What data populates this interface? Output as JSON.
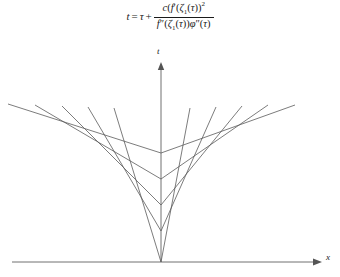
{
  "figure": {
    "title_formula": {
      "lhs": "t",
      "equals": "=",
      "tau": "τ",
      "plus": "+",
      "numerator": "c(f′(ζ₁(τ))²",
      "denominator": "f″(ζ₁(τ))φ″(τ)",
      "numerator_parts": {
        "c": "c",
        "open_paren": "(",
        "f": "f",
        "prime": "′",
        "open_paren2": "(",
        "zeta": "ζ",
        "zeta_sub": "1",
        "open_paren3": "(",
        "tau": "τ",
        "close_parens": "))",
        "exponent": "2"
      },
      "denominator_parts": {
        "f": "f",
        "double_prime": "″",
        "open_paren": "(",
        "zeta": "ζ",
        "zeta_sub": "1",
        "open_paren2": "(",
        "tau": "τ",
        "close_parens": "))",
        "phi": "φ",
        "phi_double_prime": "″",
        "open_paren3": "(",
        "tau2": "τ",
        "close_paren": ")"
      }
    },
    "axes": {
      "vertical_label": "t",
      "horizontal_label": "x",
      "origin": {
        "x": 161,
        "y": 262
      },
      "vertical_axis": {
        "x": 161,
        "y_top": 62,
        "y_bottom": 262
      },
      "horizontal_axis": {
        "y": 262,
        "x_left": 12,
        "x_right": 322
      },
      "arrow_color": "#555555",
      "axis_color": "#606060"
    }
  },
  "chart_data": {
    "type": "line",
    "title": "",
    "xlabel": "x",
    "ylabel": "t",
    "grid": false,
    "legend": null,
    "axis_ranges": {
      "xlim": [
        12,
        322
      ],
      "ylim": [
        62,
        262
      ]
    },
    "series": [
      {
        "name": "chevron-1",
        "vertex": {
          "x": 161,
          "y": 153
        },
        "left_end": {
          "x": 8,
          "y": 104
        },
        "right_end": {
          "x": 295,
          "y": 105
        }
      },
      {
        "name": "chevron-2",
        "vertex": {
          "x": 161,
          "y": 179
        },
        "left_end": {
          "x": 35,
          "y": 105
        },
        "right_end": {
          "x": 268,
          "y": 105
        }
      },
      {
        "name": "chevron-3",
        "vertex": {
          "x": 161,
          "y": 205
        },
        "left_end": {
          "x": 62,
          "y": 106
        },
        "right_end": {
          "x": 242,
          "y": 106
        }
      },
      {
        "name": "chevron-4",
        "vertex": {
          "x": 161,
          "y": 231
        },
        "left_end": {
          "x": 88,
          "y": 107
        },
        "right_end": {
          "x": 216,
          "y": 107
        }
      },
      {
        "name": "chevron-5",
        "vertex": {
          "x": 161,
          "y": 262
        },
        "left_end": {
          "x": 114,
          "y": 108
        },
        "right_end": {
          "x": 190,
          "y": 108
        }
      }
    ]
  }
}
